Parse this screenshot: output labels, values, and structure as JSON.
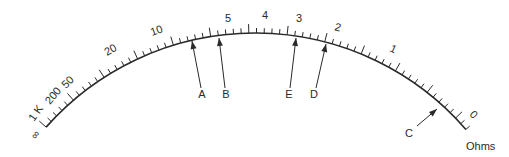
{
  "diagram": {
    "type": "ohmmeter-scale",
    "unit_label": "Ohms",
    "scale_labels": [
      {
        "text": "∞",
        "x": 36,
        "y": 140,
        "rot": -55
      },
      {
        "text": "1 K",
        "x": 34,
        "y": 122,
        "rot": -55
      },
      {
        "text": "200",
        "x": 50,
        "y": 105,
        "rot": -50
      },
      {
        "text": "50",
        "x": 66,
        "y": 89,
        "rot": -45
      },
      {
        "text": "20",
        "x": 107,
        "y": 56,
        "rot": -30
      },
      {
        "text": "10",
        "x": 152,
        "y": 36,
        "rot": -20
      },
      {
        "text": "5",
        "x": 225,
        "y": 22,
        "rot": 0
      },
      {
        "text": "4",
        "x": 262,
        "y": 19,
        "rot": 0
      },
      {
        "text": "3",
        "x": 296,
        "y": 22,
        "rot": 0
      },
      {
        "text": "2",
        "x": 334,
        "y": 30,
        "rot": 15
      },
      {
        "text": "1",
        "x": 389,
        "y": 51,
        "rot": 25
      },
      {
        "text": "0",
        "x": 469,
        "y": 115,
        "rot": 45
      }
    ],
    "pointers": [
      {
        "label": "A",
        "tip_x": 192,
        "tip_y": 41,
        "tail_x": 201,
        "tail_y": 88,
        "text_x": 202,
        "text_y": 98
      },
      {
        "label": "B",
        "tip_x": 219,
        "tip_y": 38,
        "tail_x": 225,
        "tail_y": 88,
        "text_x": 226,
        "text_y": 98
      },
      {
        "label": "E",
        "tip_x": 296,
        "tip_y": 38,
        "tail_x": 290,
        "tail_y": 88,
        "text_x": 289,
        "text_y": 98
      },
      {
        "label": "D",
        "tip_x": 326,
        "tip_y": 44,
        "tail_x": 316,
        "tail_y": 88,
        "text_x": 314,
        "text_y": 98
      },
      {
        "label": "C",
        "tip_x": 437,
        "tip_y": 109,
        "tail_x": 417,
        "tail_y": 126,
        "text_x": 409,
        "text_y": 137
      }
    ]
  }
}
